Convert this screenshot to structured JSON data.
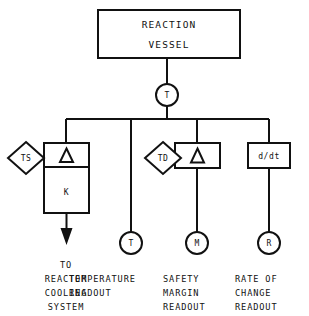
{
  "diagram": {
    "vessel": {
      "label_line1": "REACTION",
      "label_line2": "VESSEL"
    },
    "transmitter": {
      "tag": "T",
      "name": "temperature-transmitter"
    },
    "branches": [
      {
        "id": "control",
        "setpoint_diamond": "TS",
        "comparator_symbol": "△",
        "controller_label": "K",
        "output_arrow": true,
        "caption_lines": [
          "TO",
          "REACTOR",
          "COOLING",
          "SYSTEM"
        ]
      },
      {
        "id": "temperature-readout",
        "indicator_tag": "T",
        "caption_lines": [
          "TEMPERATURE",
          "READOUT"
        ]
      },
      {
        "id": "safety-margin",
        "setpoint_diamond": "TD",
        "comparator_symbol": "△",
        "indicator_tag": "M",
        "caption_lines": [
          "SAFETY",
          "MARGIN",
          "READOUT"
        ]
      },
      {
        "id": "rate-of-change",
        "operator_label": "d/dt",
        "indicator_tag": "R",
        "caption_lines": [
          "RATE OF",
          "CHANGE",
          "READOUT"
        ]
      }
    ],
    "colors": {
      "stroke": "#111111",
      "background": "#ffffff",
      "fill": "#ffffff"
    }
  }
}
